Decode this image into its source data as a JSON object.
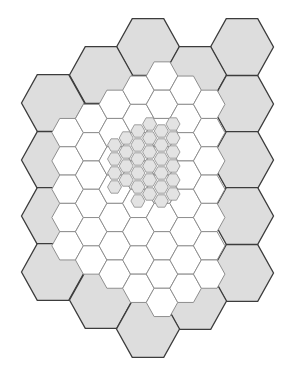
{
  "diagram": {
    "type": "hexagonal-multiresolution-grid",
    "colors": {
      "big_fill": "#dddddd",
      "big_stroke": "#3c3c3c",
      "medium_fill": "#ffffff",
      "medium_stroke": "#8e8e8e",
      "small_fill": "#e3e3e3",
      "small_stroke": "#8a8a8a"
    },
    "big_hexes": {
      "rx": 31.5,
      "ry": 28.3,
      "centers": [
        [
          148,
          47
        ],
        [
          242,
          47
        ],
        [
          101,
          75
        ],
        [
          195,
          75
        ],
        [
          242,
          104
        ],
        [
          53,
          103
        ],
        [
          53,
          160
        ],
        [
          242,
          160
        ],
        [
          53,
          216
        ],
        [
          242,
          216
        ],
        [
          53,
          272
        ],
        [
          242,
          273
        ],
        [
          101,
          300
        ],
        [
          195,
          301
        ],
        [
          148,
          329
        ]
      ]
    },
    "medium_hexes": {
      "rx": 15.75,
      "ry": 14.15,
      "columns": [
        {
          "x": 67.6,
          "ys": [
            132.6,
            160.9,
            189.2,
            217.5,
            245.8
          ]
        },
        {
          "x": 91.2,
          "ys": [
            118.5,
            146.8,
            175.1,
            203.4,
            231.7,
            260.0
          ]
        },
        {
          "x": 114.8,
          "ys": [
            104.3,
            132.6,
            160.9,
            189.2,
            217.5,
            245.8,
            274.1
          ]
        },
        {
          "x": 138.4,
          "ys": [
            90.2,
            118.5,
            146.8,
            175.1,
            203.4,
            231.7,
            260.0,
            288.3
          ]
        },
        {
          "x": 162.0,
          "ys": [
            76.0,
            104.3,
            132.6,
            160.9,
            189.2,
            217.5,
            245.8,
            274.1,
            302.4
          ]
        },
        {
          "x": 185.6,
          "ys": [
            90.2,
            118.5,
            146.8,
            175.1,
            203.4,
            231.7,
            260.0,
            288.3
          ]
        },
        {
          "x": 209.2,
          "ys": [
            104.3,
            132.6,
            160.9,
            189.2,
            217.5,
            245.8,
            274.1
          ]
        }
      ]
    },
    "small_hexes": {
      "rx": 7.0,
      "ry": 6.2,
      "columns": [
        {
          "x": 114.5,
          "ys": [
            145,
            159,
            173,
            187
          ]
        },
        {
          "x": 126.2,
          "ys": [
            138,
            152,
            166,
            180
          ]
        },
        {
          "x": 137.9,
          "ys": [
            131,
            145,
            159,
            173,
            187,
            201
          ]
        },
        {
          "x": 149.6,
          "ys": [
            124,
            138,
            152,
            166,
            180,
            194
          ]
        },
        {
          "x": 161.3,
          "ys": [
            131,
            145,
            159,
            173,
            187,
            201
          ]
        },
        {
          "x": 173.0,
          "ys": [
            124,
            138,
            152,
            166,
            180,
            194
          ]
        }
      ]
    }
  }
}
